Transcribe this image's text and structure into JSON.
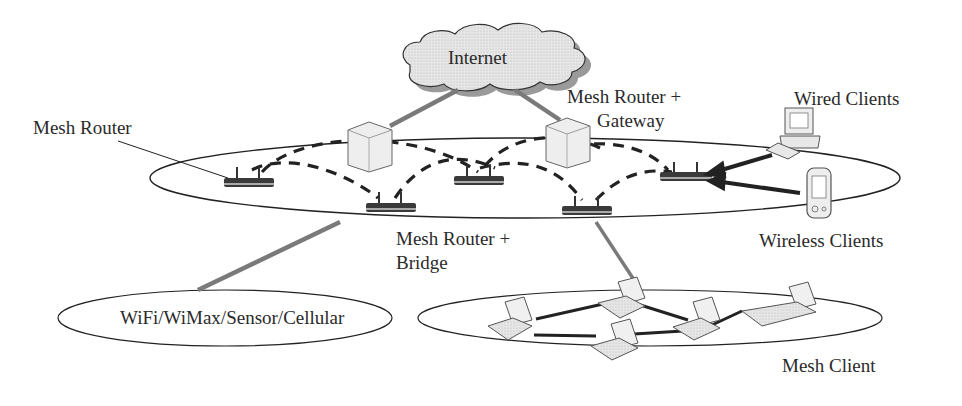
{
  "diagram": {
    "type": "wireless-mesh-network-architecture",
    "labels": {
      "internet": "Internet",
      "mesh_router": "Mesh Router",
      "gateway_line1": "Mesh Router +",
      "gateway_line2": "Gateway",
      "wired_clients": "Wired Clients",
      "bridge_line1": "Mesh Router +",
      "bridge_line2": "Bridge",
      "wireless_clients": "Wireless Clients",
      "other_networks": "WiFi/WiMax/Sensor/Cellular",
      "mesh_client": "Mesh Client"
    },
    "nodes": [
      {
        "id": "internet",
        "kind": "cloud"
      },
      {
        "id": "server-1",
        "kind": "server"
      },
      {
        "id": "server-gateway",
        "kind": "server"
      },
      {
        "id": "router-left",
        "kind": "mesh-router"
      },
      {
        "id": "router-bridge",
        "kind": "mesh-router"
      },
      {
        "id": "router-center",
        "kind": "mesh-router"
      },
      {
        "id": "router-lower-right",
        "kind": "mesh-router"
      },
      {
        "id": "router-right",
        "kind": "mesh-router"
      },
      {
        "id": "desktop",
        "kind": "wired-client"
      },
      {
        "id": "pda",
        "kind": "wireless-client"
      },
      {
        "id": "laptop-1",
        "kind": "mesh-client"
      },
      {
        "id": "laptop-2",
        "kind": "mesh-client"
      },
      {
        "id": "laptop-3",
        "kind": "mesh-client"
      },
      {
        "id": "laptop-4",
        "kind": "mesh-client"
      },
      {
        "id": "laptop-5",
        "kind": "mesh-client"
      }
    ],
    "colors": {
      "line": "#222222",
      "wired_link": "#7a7a7a",
      "dashed_link": "#222222",
      "cloud_fill": "#d8d8d8",
      "cloud_shadow": "#9a9a9a",
      "server_fill": "#ececec",
      "router_fill": "#3a3a3a",
      "laptop_fill": "#e4e4e4"
    }
  }
}
